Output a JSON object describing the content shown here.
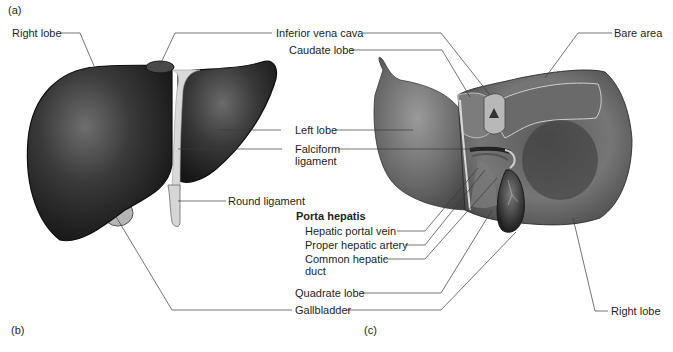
{
  "figure": {
    "panel_a": "(a)",
    "panel_b": "(b)",
    "panel_c": "(c)"
  },
  "anterior_view": {
    "labels": {
      "right_lobe": "Right lobe",
      "round_ligament": "Round ligament"
    }
  },
  "shared_labels": {
    "inferior_vena_cava": "Inferior vena cava",
    "caudate_lobe": "Caudate lobe",
    "left_lobe": "Left lobe",
    "falciform_ligament_1": "Falciform",
    "falciform_ligament_2": "ligament",
    "porta_hepatis": "Porta hepatis",
    "hepatic_portal_vein": "Hepatic portal vein",
    "proper_hepatic_artery": "Proper hepatic artery",
    "common_hepatic_duct_1": "Common hepatic",
    "common_hepatic_duct_2": "duct",
    "quadrate_lobe": "Quadrate lobe",
    "gallbladder": "Gallbladder"
  },
  "posterior_view": {
    "labels": {
      "bare_area": "Bare area",
      "right_lobe": "Right lobe"
    }
  },
  "colors": {
    "liver_dark": "#2a2a2a",
    "liver_mid": "#5a5a5a",
    "liver_light": "#8a8a8a",
    "ligament": "#d8d8d8",
    "leader_line": "#3a3a3a"
  }
}
